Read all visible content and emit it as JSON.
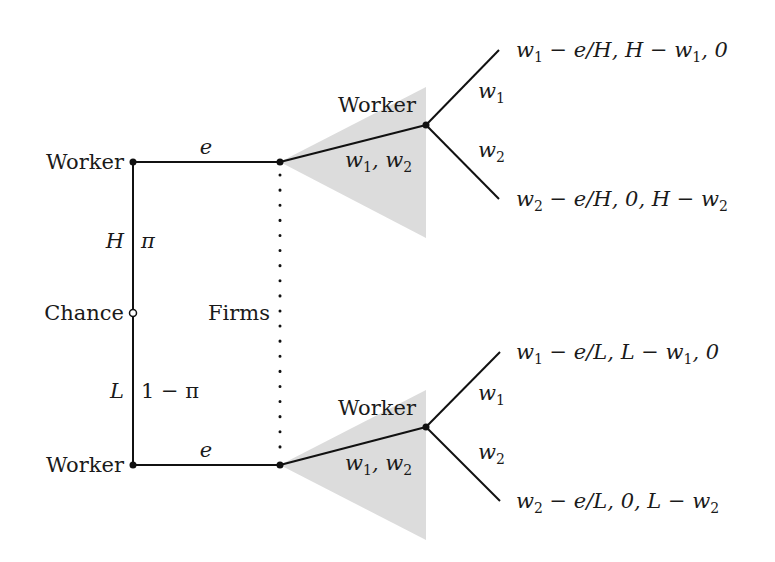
{
  "diagram": {
    "type": "game-tree",
    "nodes": {
      "chance": {
        "label": "Chance"
      },
      "worker_high": {
        "label": "Worker"
      },
      "worker_low": {
        "label": "Worker"
      },
      "firms": {
        "label": "Firms"
      },
      "worker_upper_choice": {
        "label": "Worker"
      },
      "worker_lower_choice": {
        "label": "Worker"
      }
    },
    "chance_branches": {
      "high": {
        "type": "H",
        "prob": "π"
      },
      "low": {
        "type": "L",
        "prob": "1 − π"
      }
    },
    "edges": {
      "effort_upper": "e",
      "effort_lower": "e",
      "wage_offer_upper": "w1, w2",
      "wage_offer_lower": "w1, w2",
      "choice_upper_1": "w1",
      "choice_upper_2": "w2",
      "choice_lower_1": "w1",
      "choice_lower_2": "w2"
    },
    "payoffs": {
      "high_w1": "w1 − e/H, H − w1, 0",
      "high_w2": "w2 − e/H, 0, H − w2",
      "low_w1": "w1 − e/L, L − w1, 0",
      "low_w2": "w2 − e/L, 0, L − w2"
    },
    "colors": {
      "line": "#111111",
      "shade": "#d9d9d9",
      "text": "#1a1a1a"
    }
  }
}
